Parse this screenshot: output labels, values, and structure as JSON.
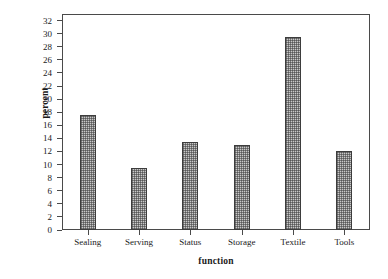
{
  "chart_data": {
    "type": "bar",
    "title": "",
    "subtitle": "",
    "xlabel": "function",
    "ylabel": "percent",
    "categories": [
      "Sealing",
      "Serving",
      "Status",
      "Storage",
      "Textile",
      "Tools"
    ],
    "values": [
      17.5,
      9.5,
      13.4,
      13.0,
      29.5,
      12.0
    ],
    "ylim": [
      0,
      33
    ],
    "ytick_values": [
      0,
      2,
      4,
      6,
      8,
      10,
      12,
      14,
      16,
      18,
      20,
      22,
      24,
      26,
      28,
      30,
      32
    ],
    "ytick_labels": [
      "0",
      "2",
      "4",
      "6",
      "8",
      "10",
      "12",
      "14",
      "16",
      "18",
      "20",
      "22",
      "24",
      "26",
      "28",
      "30",
      "32"
    ],
    "grid": false,
    "legend": null,
    "legend_position": "none",
    "bar_fill_color": "#c9c9c9",
    "bar_edge_color": "#3d3d3d",
    "axis_color": "#4a4a4a",
    "background_color": "#ffffff"
  }
}
